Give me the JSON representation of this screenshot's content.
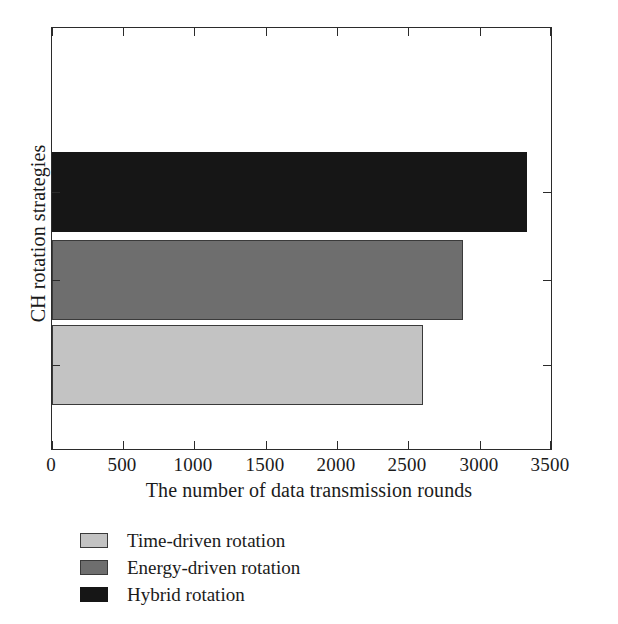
{
  "chart_data": {
    "type": "bar",
    "orientation": "horizontal",
    "title": "",
    "xlabel": "The number of data transmission rounds",
    "ylabel": "CH rotation strategies",
    "categories": [
      "Time-driven rotation",
      "Energy-driven rotation",
      "Hybrid rotation"
    ],
    "values": [
      2600,
      2880,
      3330
    ],
    "xlim": [
      0,
      3500
    ],
    "xticks": [
      0,
      500,
      1000,
      1500,
      2000,
      2500,
      3000,
      3500
    ],
    "xticklabels": [
      "0",
      "500",
      "1000",
      "1500",
      "2000",
      "2500",
      "3000",
      "3500"
    ],
    "grid": false,
    "legend_position": "below-axes",
    "series": [
      {
        "name": "Time-driven rotation",
        "value": 2600,
        "color": "#c3c3c3"
      },
      {
        "name": "Energy-driven rotation",
        "value": 2880,
        "color": "#6e6e6e"
      },
      {
        "name": "Hybrid rotation",
        "value": 3330,
        "color": "#161616"
      }
    ]
  },
  "axes": {
    "xlabel": "The number of data transmission rounds",
    "ylabel": "CH rotation strategies",
    "ticklabels": {
      "t0": "0",
      "t1": "500",
      "t2": "1000",
      "t3": "1500",
      "t4": "2000",
      "t5": "2500",
      "t6": "3000",
      "t7": "3500"
    }
  },
  "legend": {
    "items": [
      {
        "label": "Time-driven rotation",
        "swatch": "light-gray-swatch"
      },
      {
        "label": "Energy-driven rotation",
        "swatch": "medium-gray-swatch"
      },
      {
        "label": "Hybrid rotation",
        "swatch": "black-swatch"
      }
    ]
  },
  "colors": {
    "light_gray": "#c3c3c3",
    "medium_gray": "#6e6e6e",
    "black": "#161616",
    "axis": "#2b2b2b",
    "background": "#ffffff"
  }
}
